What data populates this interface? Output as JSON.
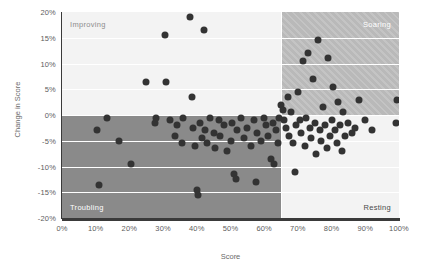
{
  "chart_data": {
    "type": "scatter",
    "title": "",
    "xlabel": "Score",
    "ylabel": "Change in Score",
    "xlim": [
      0,
      100
    ],
    "ylim": [
      -20,
      20
    ],
    "xticks": [
      "0%",
      "10%",
      "20%",
      "30%",
      "40%",
      "50%",
      "60%",
      "70%",
      "80%",
      "90%",
      "100%"
    ],
    "xtick_values": [
      0,
      10,
      20,
      30,
      40,
      50,
      60,
      70,
      80,
      90,
      100
    ],
    "yticks": [
      "20%",
      "15%",
      "10%",
      "5%",
      "0%",
      "-5%",
      "-10%",
      "-15%",
      "-20%"
    ],
    "ytick_values": [
      20,
      15,
      10,
      5,
      0,
      -5,
      -10,
      -15,
      -20
    ],
    "grid": true,
    "legend": "none",
    "reference_lines": {
      "vertical_x": 65,
      "horizontal_y": 0
    },
    "quadrant_labels": {
      "top_left": "Improving",
      "top_right": "Soaring",
      "bottom_left": "Troubling",
      "bottom_right": "Resting"
    },
    "series": [
      {
        "name": "Scores",
        "marker": "circle",
        "color": "#333333",
        "points": [
          [
            10.5,
            -3.0
          ],
          [
            11.0,
            -13.5
          ],
          [
            13.5,
            -0.5
          ],
          [
            17.0,
            -5.0
          ],
          [
            20.5,
            -9.5
          ],
          [
            25.0,
            6.5
          ],
          [
            27.5,
            -1.5
          ],
          [
            28.0,
            -0.5
          ],
          [
            30.5,
            15.5
          ],
          [
            31.0,
            6.5
          ],
          [
            32.0,
            -1.0
          ],
          [
            33.5,
            -4.0
          ],
          [
            34.0,
            -2.0
          ],
          [
            35.5,
            -5.5
          ],
          [
            36.0,
            -0.5
          ],
          [
            38.0,
            19.0
          ],
          [
            38.5,
            3.5
          ],
          [
            39.0,
            -2.5
          ],
          [
            39.5,
            -6.0
          ],
          [
            40.0,
            -14.5
          ],
          [
            40.5,
            -15.5
          ],
          [
            41.0,
            -1.5
          ],
          [
            41.5,
            -4.5
          ],
          [
            42.0,
            16.5
          ],
          [
            42.5,
            -3.0
          ],
          [
            43.0,
            -5.5
          ],
          [
            44.0,
            -0.5
          ],
          [
            45.0,
            -3.5
          ],
          [
            45.5,
            -6.5
          ],
          [
            46.5,
            -1.0
          ],
          [
            47.0,
            -4.0
          ],
          [
            48.0,
            -2.0
          ],
          [
            49.0,
            -7.0
          ],
          [
            50.0,
            -5.0
          ],
          [
            50.5,
            -1.5
          ],
          [
            51.0,
            -11.5
          ],
          [
            51.5,
            -12.5
          ],
          [
            52.0,
            -3.0
          ],
          [
            53.0,
            -0.5
          ],
          [
            54.0,
            -4.5
          ],
          [
            55.0,
            -2.5
          ],
          [
            56.0,
            -6.0
          ],
          [
            57.0,
            -1.0
          ],
          [
            57.5,
            -13.0
          ],
          [
            58.0,
            -3.5
          ],
          [
            59.0,
            -5.0
          ],
          [
            60.0,
            -0.5
          ],
          [
            60.5,
            -2.0
          ],
          [
            61.0,
            -4.0
          ],
          [
            62.0,
            -8.5
          ],
          [
            62.5,
            -1.5
          ],
          [
            63.0,
            -9.5
          ],
          [
            63.5,
            -3.0
          ],
          [
            64.0,
            -5.5
          ],
          [
            64.5,
            -0.5
          ],
          [
            65.0,
            2.0
          ],
          [
            65.5,
            1.0
          ],
          [
            66.0,
            -1.0
          ],
          [
            66.5,
            -2.5
          ],
          [
            67.0,
            3.5
          ],
          [
            67.5,
            -4.0
          ],
          [
            68.0,
            0.5
          ],
          [
            68.5,
            -5.5
          ],
          [
            69.0,
            -11.0
          ],
          [
            69.5,
            -2.0
          ],
          [
            70.0,
            4.5
          ],
          [
            70.5,
            -1.0
          ],
          [
            71.0,
            -3.5
          ],
          [
            71.5,
            10.5
          ],
          [
            72.0,
            -6.0
          ],
          [
            72.5,
            -0.5
          ],
          [
            73.0,
            12.0
          ],
          [
            73.5,
            -2.5
          ],
          [
            74.0,
            -4.5
          ],
          [
            74.5,
            7.0
          ],
          [
            75.0,
            -1.5
          ],
          [
            75.5,
            -7.5
          ],
          [
            76.0,
            14.5
          ],
          [
            76.5,
            -3.0
          ],
          [
            77.0,
            -5.0
          ],
          [
            77.5,
            1.5
          ],
          [
            78.0,
            -2.0
          ],
          [
            78.5,
            -6.5
          ],
          [
            79.0,
            11.0
          ],
          [
            79.5,
            -4.0
          ],
          [
            80.0,
            -1.0
          ],
          [
            80.5,
            5.5
          ],
          [
            81.0,
            -3.0
          ],
          [
            81.5,
            -5.5
          ],
          [
            82.0,
            2.5
          ],
          [
            82.5,
            -2.0
          ],
          [
            83.0,
            -7.0
          ],
          [
            83.5,
            0.5
          ],
          [
            84.0,
            -4.0
          ],
          [
            85.0,
            -1.5
          ],
          [
            86.0,
            -3.5
          ],
          [
            87.0,
            -2.5
          ],
          [
            88.0,
            3.0
          ],
          [
            90.0,
            -1.0
          ],
          [
            92.0,
            -3.0
          ],
          [
            99.5,
            3.0
          ],
          [
            99.0,
            -1.5
          ]
        ]
      }
    ]
  }
}
